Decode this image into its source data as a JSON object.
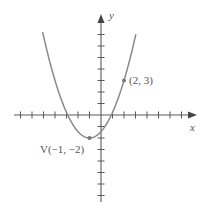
{
  "chart_data": {
    "type": "line",
    "title": "",
    "equation": "y = (5/9)(x + 1)^2 - 2",
    "xlabel": "x",
    "ylabel": "y",
    "xlim": [
      -7,
      8
    ],
    "ylim": [
      -7,
      8
    ],
    "grid": false,
    "tick_spacing": 1,
    "series": [
      {
        "name": "parabola",
        "x": [
          -5.07,
          -4,
          -3,
          -2,
          -1,
          0,
          1,
          2,
          3.07
        ],
        "values": [
          7.2,
          3.0,
          0.22,
          -1.44,
          -2,
          -1.44,
          0.22,
          3.0,
          7.2
        ]
      }
    ],
    "points": [
      {
        "label": "V(−1, −2)",
        "x": -1,
        "y": -2
      },
      {
        "label": "(2, 3)",
        "x": 2,
        "y": 3
      }
    ],
    "annotations": [
      "V(−1, −2)",
      "(2, 3)"
    ]
  },
  "labels": {
    "x_axis": "x",
    "y_axis": "y",
    "vertex": "V(−1, −2)",
    "point": "(2, 3)"
  },
  "colors": {
    "curve": "#8a8a8a",
    "axis": "#5a5a5a",
    "point": "#777777"
  }
}
